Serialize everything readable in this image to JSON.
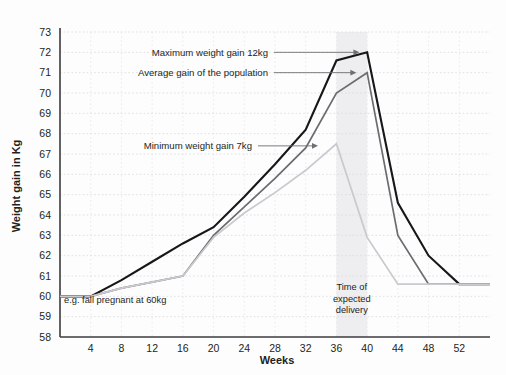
{
  "chart_data": {
    "type": "line",
    "title": "",
    "xlabel": "Weeks",
    "ylabel": "Weight gain in Kg",
    "xlim": [
      0,
      56
    ],
    "ylim": [
      58,
      73
    ],
    "grid": true,
    "legend": "none (direct annotations)",
    "x_ticks": [
      4,
      8,
      12,
      16,
      20,
      24,
      28,
      32,
      36,
      40,
      44,
      48,
      52
    ],
    "y_ticks": [
      58,
      59,
      60,
      61,
      62,
      63,
      64,
      65,
      66,
      67,
      68,
      69,
      70,
      71,
      72,
      73
    ],
    "series": [
      {
        "name": "Maximum weight gain 12kg",
        "color": "#17171a",
        "width": 2.1,
        "x": [
          0,
          4,
          8,
          12,
          16,
          20,
          24,
          28,
          32,
          36,
          40,
          44,
          48,
          52,
          56
        ],
        "values": [
          60,
          60,
          60.8,
          61.7,
          62.6,
          63.4,
          64.9,
          66.5,
          68.2,
          71.6,
          72.0,
          64.6,
          62.0,
          60.6,
          60.6
        ]
      },
      {
        "name": "Average gain of the population",
        "color": "#6b6b70",
        "width": 1.7,
        "x": [
          0,
          4,
          8,
          12,
          16,
          20,
          24,
          28,
          32,
          36,
          40,
          44,
          48,
          52,
          56
        ],
        "values": [
          60,
          60,
          60.4,
          60.7,
          61.0,
          63.0,
          64.4,
          65.8,
          67.3,
          70.0,
          71.0,
          63.0,
          60.6,
          60.6,
          60.6
        ]
      },
      {
        "name": "Minimum weight gain 7kg",
        "color": "#c9c9ce",
        "width": 1.7,
        "x": [
          0,
          4,
          8,
          12,
          16,
          20,
          24,
          28,
          32,
          36,
          40,
          44,
          48,
          52,
          56
        ],
        "values": [
          60,
          60,
          60.4,
          60.7,
          61.0,
          62.9,
          64.1,
          65.1,
          66.2,
          67.5,
          62.9,
          60.6,
          60.6,
          60.6,
          60.6
        ]
      }
    ],
    "annotations": [
      {
        "id": "max",
        "label": "Maximum weight gain 12kg",
        "target_x": 39.0,
        "target_y": 71.95,
        "text_y": 72.0
      },
      {
        "id": "avg",
        "label": "Average gain of the population",
        "target_x": 38.6,
        "target_y": 70.55,
        "text_y": 71.0
      },
      {
        "id": "min",
        "label": "Minimum weight gain 7kg",
        "target_x": 33.6,
        "target_y": 67.0,
        "text_y": 67.4
      }
    ],
    "span_band": {
      "label_lines": [
        "Time of",
        "expected",
        "delivery"
      ],
      "x_start": 36,
      "x_end": 40,
      "color": "#ebebed"
    },
    "baseline_note": "e.g. fall pregnant at 60kg"
  }
}
